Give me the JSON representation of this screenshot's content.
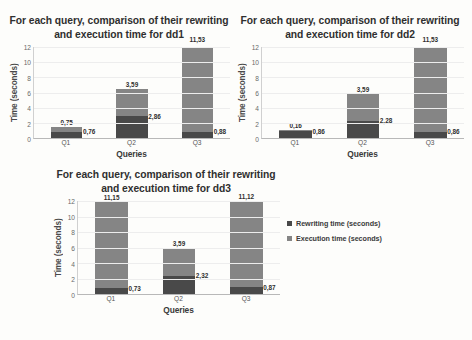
{
  "legend": {
    "items": [
      {
        "label": "Rewriting time (seconds)",
        "color": "#494949"
      },
      {
        "label": "Execution time (seconds)",
        "color": "#858585"
      }
    ]
  },
  "charts": [
    {
      "id": "dd1",
      "title": "For each query, comparison of their rewriting and execution time for dd1",
      "chart_data": {
        "type": "bar",
        "title": "For each query, comparison of their rewriting and execution time for dd1",
        "xlabel": "Queries",
        "ylabel": "Time (seconds)",
        "categories": [
          "Q1",
          "Q2",
          "Q3"
        ],
        "yticks": [
          0,
          2,
          4,
          6,
          8,
          10,
          12
        ],
        "ylim": [
          0,
          12
        ],
        "grid": true,
        "legend_position": "right",
        "stacked": true,
        "series": [
          {
            "name": "Rewriting time (seconds)",
            "values": [
              0.76,
              2.86,
              0.88
            ],
            "color": "#494949"
          },
          {
            "name": "Execution time (seconds)",
            "values": [
              0.75,
              3.59,
              11.53
            ],
            "color": "#858585"
          }
        ],
        "labels_top": [
          "0,75",
          "3,59",
          "11,53"
        ],
        "labels_side": [
          "0,76",
          "2,86",
          "0,88"
        ]
      }
    },
    {
      "id": "dd2",
      "title": "For each query, comparison of their rewriting and execution time for dd2",
      "chart_data": {
        "type": "bar",
        "title": "For each query, comparison of their rewriting and execution time for dd2",
        "xlabel": "Queries",
        "ylabel": "Time (seconds)",
        "categories": [
          "Q1",
          "Q2",
          "Q3"
        ],
        "yticks": [
          0,
          2,
          4,
          6,
          8,
          10,
          12
        ],
        "ylim": [
          0,
          12
        ],
        "grid": true,
        "legend_position": "right",
        "stacked": true,
        "series": [
          {
            "name": "Rewriting time (seconds)",
            "values": [
              0.86,
              2.28,
              0.86
            ],
            "color": "#494949"
          },
          {
            "name": "Execution time (seconds)",
            "values": [
              0.16,
              3.59,
              11.53
            ],
            "color": "#858585"
          }
        ],
        "labels_top": [
          "0,16",
          "3,59",
          "11,53"
        ],
        "labels_side": [
          "0,86",
          "2,28",
          "0,86"
        ]
      }
    },
    {
      "id": "dd3",
      "title": "For each query, comparison of their rewriting and execution time for dd3",
      "chart_data": {
        "type": "bar",
        "title": "For each query, comparison of their rewriting and execution time for dd3",
        "xlabel": "Queries",
        "ylabel": "Time (seconds)",
        "categories": [
          "Q1",
          "Q2",
          "Q3"
        ],
        "yticks": [
          0,
          2,
          4,
          6,
          8,
          10,
          12
        ],
        "ylim": [
          0,
          12
        ],
        "grid": true,
        "legend_position": "right",
        "stacked": true,
        "series": [
          {
            "name": "Rewriting time (seconds)",
            "values": [
              0.73,
              2.32,
              0.87
            ],
            "color": "#494949"
          },
          {
            "name": "Execution time (seconds)",
            "values": [
              11.15,
              3.59,
              11.12
            ],
            "color": "#858585"
          }
        ],
        "labels_top": [
          "11,15",
          "3,59",
          "11,12"
        ],
        "labels_side": [
          "0,73",
          "2,32",
          "0,87"
        ]
      }
    }
  ]
}
